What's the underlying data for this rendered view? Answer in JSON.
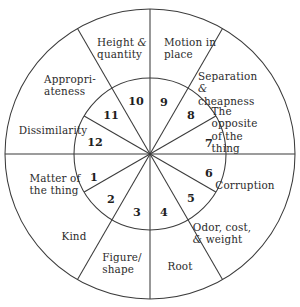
{
  "figure": {
    "kind": "concentric-wheel-diagram",
    "title": "",
    "geometry": {
      "center_x": 150,
      "center_y": 154,
      "outer_radius": 145,
      "inner_radius": 76,
      "inner_sector_count": 12,
      "outer_sector_count": 8,
      "inner_sector_step_degrees": 30,
      "outer_boundary_degrees": [
        0,
        60,
        90,
        120,
        180,
        240,
        270,
        300
      ]
    },
    "colors": {
      "stroke": "#3b3b3b",
      "background": "#ffffff",
      "text": "#2b2b2b"
    }
  },
  "outer_ring": {
    "sectors": [
      {
        "id": "outer-1",
        "label": "Height &\nquantity",
        "label_x": 122,
        "label_y": 48,
        "start_deg": 90,
        "end_deg": 120
      },
      {
        "id": "outer-2",
        "label": "Motion in\nplace",
        "label_x": 190,
        "label_y": 48,
        "start_deg": 60,
        "end_deg": 90
      },
      {
        "id": "outer-3",
        "label": "Separation &\ncheapness",
        "label_x": 232,
        "label_y": 88,
        "start_deg": 30,
        "end_deg": 60
      },
      {
        "id": "outer-4",
        "label": "The opposite\nof the thing",
        "label_x": 241,
        "label_y": 130,
        "start_deg": 0,
        "end_deg": 30
      },
      {
        "id": "outer-5",
        "label": "Corruption",
        "label_x": 245,
        "label_y": 185,
        "start_deg": 300,
        "end_deg": 360
      },
      {
        "id": "outer-6",
        "label": "Odor, cost,\n& weight",
        "label_x": 222,
        "label_y": 233,
        "start_deg": 270,
        "end_deg": 300
      },
      {
        "id": "outer-7",
        "label": "Root",
        "label_x": 180,
        "label_y": 266,
        "start_deg": 240,
        "end_deg": 270
      },
      {
        "id": "outer-8",
        "label": "Figure/\nshape",
        "label_x": 122,
        "label_y": 263,
        "start_deg": 210,
        "end_deg": 240
      },
      {
        "id": "outer-9",
        "label": "Kind",
        "label_x": 74,
        "label_y": 236,
        "start_deg": 180,
        "end_deg": 210
      },
      {
        "id": "outer-10",
        "label": "Matter of\nthe thing",
        "label_x": 55,
        "label_y": 184,
        "start_deg": 150,
        "end_deg": 180
      },
      {
        "id": "outer-11",
        "label": "Dissimilarity",
        "label_x": 53,
        "label_y": 130,
        "start_deg": 150,
        "end_deg": 180
      },
      {
        "id": "outer-12",
        "label": "Appropri-\nateness",
        "label_x": 70,
        "label_y": 85,
        "start_deg": 120,
        "end_deg": 150
      }
    ]
  },
  "inner_ring": {
    "sectors": [
      {
        "id": "inner-1",
        "number": "1",
        "label_x": 94,
        "label_y": 178
      },
      {
        "id": "inner-2",
        "number": "2",
        "label_x": 111,
        "label_y": 200
      },
      {
        "id": "inner-3",
        "number": "3",
        "label_x": 137,
        "label_y": 213
      },
      {
        "id": "inner-4",
        "number": "4",
        "label_x": 164,
        "label_y": 213
      },
      {
        "id": "inner-5",
        "number": "5",
        "label_x": 191,
        "label_y": 199
      },
      {
        "id": "inner-6",
        "number": "6",
        "label_x": 209,
        "label_y": 174
      },
      {
        "id": "inner-7",
        "number": "7",
        "label_x": 209,
        "label_y": 144
      },
      {
        "id": "inner-8",
        "number": "8",
        "label_x": 191,
        "label_y": 116
      },
      {
        "id": "inner-9",
        "number": "9",
        "label_x": 164,
        "label_y": 103
      },
      {
        "id": "inner-10",
        "number": "10",
        "label_x": 136,
        "label_y": 102
      },
      {
        "id": "inner-11",
        "number": "11",
        "label_x": 111,
        "label_y": 116
      },
      {
        "id": "inner-12",
        "number": "12",
        "label_x": 95,
        "label_y": 143
      }
    ]
  }
}
